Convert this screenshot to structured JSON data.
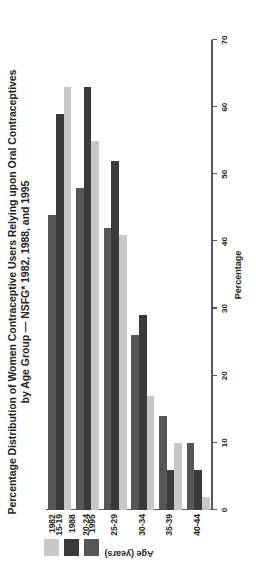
{
  "chart_data": {
    "type": "bar",
    "orientation": "horizontal",
    "title": "Percentage Distribution of Women Contraceptive Users Relying upon Oral Contraceptives by Age Group — NSFG* 1982, 1988, and 1995",
    "title_lines": [
      "Percentage Distribution of Women Contraceptive Users Relying upon Oral Contraceptives",
      "by Age Group — NSFG* 1982, 1988, and 1995"
    ],
    "xlabel": "Percentage",
    "ylabel": "Age (years)",
    "categories": [
      "15-19",
      "20-24",
      "25-29",
      "30-34",
      "35-39",
      "40-44"
    ],
    "xlim": [
      0,
      70
    ],
    "xticks": [
      0,
      10,
      20,
      30,
      40,
      50,
      60,
      70
    ],
    "xtick_labels": [
      "0",
      "10",
      "20",
      "30",
      "40",
      "50",
      "60",
      "70"
    ],
    "grid": false,
    "legend_position": "top-left",
    "series": [
      {
        "name": "1982",
        "color": "#c8c8c8",
        "values": [
          63,
          55,
          41,
          17,
          10,
          2
        ]
      },
      {
        "name": "1988",
        "color": "#3a3a3a",
        "values": [
          59,
          63,
          52,
          29,
          6,
          6
        ]
      },
      {
        "name": "1995",
        "color": "#565656",
        "values": [
          44,
          48,
          42,
          26,
          14,
          10
        ]
      }
    ]
  },
  "legend": {
    "items": [
      {
        "label": "1982",
        "color": "#c8c8c8"
      },
      {
        "label": "1988",
        "color": "#3a3a3a"
      },
      {
        "label": "1995",
        "color": "#565656"
      }
    ]
  }
}
